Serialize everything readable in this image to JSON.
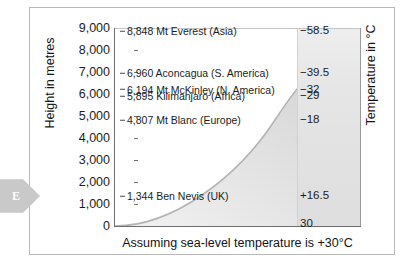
{
  "marker": {
    "letter": "E",
    "icon": "arrow-right-pentagon"
  },
  "chart_data": {
    "type": "area",
    "title": "",
    "xlabel": "Assuming sea-level temperature is +30°C",
    "ylabel": "Height in metres",
    "y2label": "Temperature in °C",
    "ylim": [
      0,
      9000
    ],
    "y_ticks": [
      "0",
      "1,000",
      "2,000",
      "3,000",
      "4,000",
      "5,000",
      "6,000",
      "7,000",
      "8,000",
      "9,000"
    ],
    "y_tick_values": [
      0,
      1000,
      2000,
      3000,
      4000,
      5000,
      6000,
      7000,
      8000,
      9000
    ],
    "grid": false,
    "legend": "none",
    "series": [
      {
        "name": "Temperature vs altitude",
        "x_label_axis": "Temperature in °C",
        "heights_m": [
          0,
          1344,
          4807,
          5895,
          6194,
          6960,
          8848
        ],
        "temperatures_c": [
          30,
          16.5,
          -18,
          -29,
          -32,
          -39.5,
          -58.5
        ]
      }
    ],
    "annotations": [
      {
        "height": "8,848",
        "name": "Mt Everest (Asia)",
        "height_value": 8848,
        "label": "8,848 Mt Everest (Asia)"
      },
      {
        "height": "6,960",
        "name": "Aconcagua (S. America)",
        "height_value": 6960,
        "label": "6,960 Aconcagua (S. America)"
      },
      {
        "height": "6,194",
        "name": "Mt McKinley (N. America)",
        "height_value": 6194,
        "label": "6,194 Mt McKinley (N. America)"
      },
      {
        "height": "5,895",
        "name": "Kilimanjaro (Africa)",
        "height_value": 5895,
        "label": "5,895 Kilimanjaro (Africa)"
      },
      {
        "height": "4,807",
        "name": "Mt Blanc (Europe)",
        "height_value": 4807,
        "label": "4,807 Mt Blanc (Europe)"
      },
      {
        "height": "1,344",
        "name": "Ben Nevis (UK)",
        "height_value": 1344,
        "label": "1,344 Ben Nevis (UK)"
      }
    ],
    "temperature_labels": [
      {
        "text": "−58.5",
        "height_value": 8848,
        "value": -58.5
      },
      {
        "text": "−39.5",
        "height_value": 6960,
        "value": -39.5
      },
      {
        "text": "−32",
        "height_value": 6194,
        "value": -32
      },
      {
        "text": "−29",
        "height_value": 5895,
        "value": -29
      },
      {
        "text": "−18",
        "height_value": 4807,
        "value": -18
      },
      {
        "text": "+16.5",
        "height_value": 1344,
        "value": 16.5
      },
      {
        "text": "30",
        "height_value": 100,
        "value": 30
      }
    ],
    "colors": {
      "axis": "#6f6f6f",
      "curve": "#b0b0b0",
      "area_fill": "#dcdcdc",
      "panel": "#e4e4e4",
      "text": "#1c1c1c",
      "marker": "#c9c9c9"
    }
  }
}
